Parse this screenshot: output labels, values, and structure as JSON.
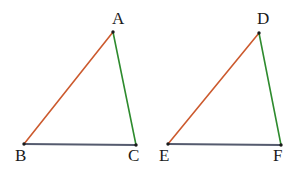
{
  "figure": {
    "type": "geometry-diagram",
    "background_color": "#ffffff",
    "width": 305,
    "height": 174,
    "colors": {
      "hypotenuse_red": "#cc5a2e",
      "right_side_green": "#2e8b2e",
      "base_slate": "#555b6e",
      "vertex_dot": "#1a1a1a",
      "label_text": "#1a1a1a"
    },
    "stroke_width": 1.6,
    "shapes": [
      {
        "name": "triangle-abc",
        "vertices": [
          {
            "label": "A",
            "x": 113,
            "y": 32,
            "label_x": 112,
            "label_y": 10,
            "label_anchor": "above"
          },
          {
            "label": "B",
            "x": 24,
            "y": 144,
            "label_x": 15,
            "label_y": 147,
            "label_anchor": "below-left"
          },
          {
            "label": "C",
            "x": 136,
            "y": 145,
            "label_x": 128,
            "label_y": 147,
            "label_anchor": "below-right"
          }
        ],
        "edges": [
          {
            "name": "edge-AB",
            "from": "A",
            "to": "B",
            "color": "#cc5a2e"
          },
          {
            "name": "edge-AC",
            "from": "A",
            "to": "C",
            "color": "#2e8b2e"
          },
          {
            "name": "edge-BC",
            "from": "B",
            "to": "C",
            "color": "#555b6e"
          }
        ]
      },
      {
        "name": "triangle-def",
        "vertices": [
          {
            "label": "D",
            "x": 259,
            "y": 33,
            "label_x": 257,
            "label_y": 10,
            "label_anchor": "above"
          },
          {
            "label": "E",
            "x": 168,
            "y": 144,
            "label_x": 159,
            "label_y": 147,
            "label_anchor": "below-left"
          },
          {
            "label": "F",
            "x": 281,
            "y": 145,
            "label_x": 273,
            "label_y": 147,
            "label_anchor": "below-right"
          }
        ],
        "edges": [
          {
            "name": "edge-DE",
            "from": "D",
            "to": "E",
            "color": "#cc5a2e"
          },
          {
            "name": "edge-DF",
            "from": "D",
            "to": "F",
            "color": "#2e8b2e"
          },
          {
            "name": "edge-EF",
            "from": "E",
            "to": "F",
            "color": "#555b6e"
          }
        ]
      }
    ]
  },
  "labels": {
    "A": "A",
    "B": "B",
    "C": "C",
    "D": "D",
    "E": "E",
    "F": "F"
  }
}
